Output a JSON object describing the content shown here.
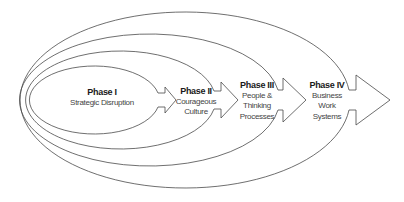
{
  "diagram": {
    "type": "nested-phases",
    "stroke_color": "#4a4a4a",
    "background": "#ffffff",
    "phases": [
      {
        "title": "Phase I",
        "description_lines": [
          "Strategic Disruption"
        ]
      },
      {
        "title": "Phase II",
        "description_lines": [
          "Courageous",
          "Culture"
        ]
      },
      {
        "title": "Phase III",
        "description_lines": [
          "People &",
          "Thinking",
          "Processes"
        ]
      },
      {
        "title": "Phase IV",
        "description_lines": [
          "Business",
          "Work",
          "Systems"
        ]
      }
    ]
  }
}
